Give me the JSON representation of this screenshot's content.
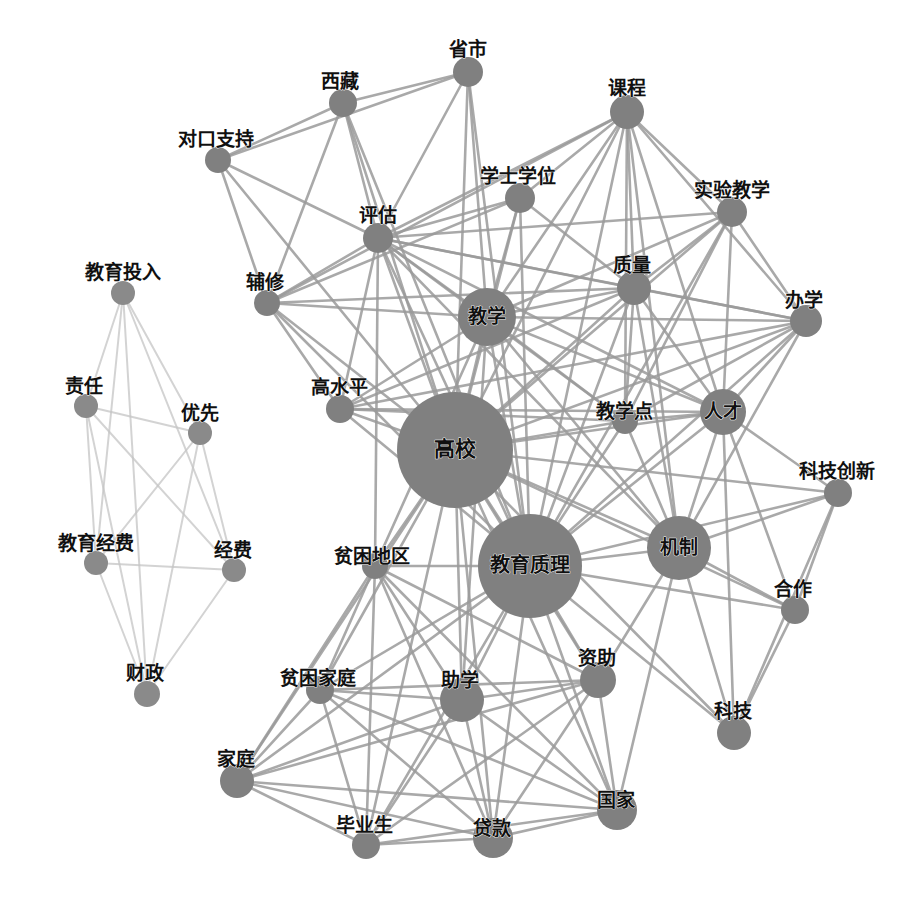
{
  "figure": {
    "type": "network-graph",
    "title": "",
    "background_color": "#ffffff",
    "node_color": "#808080",
    "node_color_secondary": "#8a8a8a",
    "edge_color": "#9a9a9a",
    "edge_color_light": "#c4c4c4",
    "label_color": "#101010",
    "width": 924,
    "height": 897
  },
  "chart_data": {
    "type": "network",
    "title": "",
    "xlabel": "",
    "ylabel": "",
    "legend": [],
    "grid": false,
    "node_count": 33,
    "edge_count": 178,
    "cluster_names": [
      "main-education-quality-cluster",
      "education-funding-cluster"
    ],
    "nodes": [
      {
        "id": "shengshi",
        "label": "省市",
        "x": 468,
        "y": 72,
        "r": 15,
        "label_dx": 0,
        "label_dy": -22,
        "fs": 19,
        "cluster": 0
      },
      {
        "id": "xizang",
        "label": "西藏",
        "x": 343,
        "y": 103,
        "r": 14,
        "label_dx": -3,
        "label_dy": -21,
        "fs": 19,
        "cluster": 0
      },
      {
        "id": "kecheng",
        "label": "课程",
        "x": 627,
        "y": 112,
        "r": 17,
        "label_dx": 0,
        "label_dy": -23,
        "fs": 19,
        "cluster": 0
      },
      {
        "id": "duikouzhichi",
        "label": "对口支持",
        "x": 218,
        "y": 160,
        "r": 13,
        "label_dx": -2,
        "label_dy": -20,
        "fs": 19,
        "cluster": 0
      },
      {
        "id": "xueshixuewei",
        "label": "学士学位",
        "x": 520,
        "y": 198,
        "r": 15,
        "label_dx": -2,
        "label_dy": -21,
        "fs": 19,
        "cluster": 0
      },
      {
        "id": "shiyanjiaoxue",
        "label": "实验教学",
        "x": 732,
        "y": 212,
        "r": 15,
        "label_dx": 0,
        "label_dy": -21,
        "fs": 19,
        "cluster": 0
      },
      {
        "id": "pinggu",
        "label": "评估",
        "x": 378,
        "y": 238,
        "r": 15,
        "label_dx": 0,
        "label_dy": -22,
        "fs": 19,
        "cluster": 0
      },
      {
        "id": "jiaoyutouru",
        "label": "教育投入",
        "x": 123,
        "y": 293,
        "r": 12,
        "label_dx": 0,
        "label_dy": -20,
        "fs": 19,
        "cluster": 1
      },
      {
        "id": "zhiliang",
        "label": "质量",
        "x": 634,
        "y": 288,
        "r": 17,
        "label_dx": -2,
        "label_dy": -22,
        "fs": 19,
        "cluster": 0
      },
      {
        "id": "fuxiu",
        "label": "辅修",
        "x": 267,
        "y": 303,
        "r": 13,
        "label_dx": -2,
        "label_dy": -20,
        "fs": 19,
        "cluster": 0
      },
      {
        "id": "jiaoxue",
        "label": "教学",
        "x": 487,
        "y": 317,
        "r": 29,
        "label_dx": 0,
        "label_dy": 0,
        "fs": 19,
        "cluster": 0
      },
      {
        "id": "banxue",
        "label": "办学",
        "x": 806,
        "y": 321,
        "r": 16,
        "label_dx": -2,
        "label_dy": -20,
        "fs": 19,
        "cluster": 0
      },
      {
        "id": "zeren",
        "label": "责任",
        "x": 86,
        "y": 406,
        "r": 12,
        "label_dx": -2,
        "label_dy": -19,
        "fs": 19,
        "cluster": 1
      },
      {
        "id": "youxian",
        "label": "优先",
        "x": 200,
        "y": 433,
        "r": 12,
        "label_dx": 0,
        "label_dy": -19,
        "fs": 19,
        "cluster": 1
      },
      {
        "id": "gaoshuiping",
        "label": "高水平",
        "x": 340,
        "y": 409,
        "r": 14,
        "label_dx": -1,
        "label_dy": -21,
        "fs": 19,
        "cluster": 0
      },
      {
        "id": "rencai",
        "label": "人才",
        "x": 723,
        "y": 412,
        "r": 23,
        "label_dx": 0,
        "label_dy": 0,
        "fs": 19,
        "cluster": 0
      },
      {
        "id": "jiaoxuedian",
        "label": "教学点",
        "x": 625,
        "y": 421,
        "r": 13,
        "label_dx": -1,
        "label_dy": -9,
        "fs": 19,
        "cluster": 0
      },
      {
        "id": "gaoxiao",
        "label": "高校",
        "x": 455,
        "y": 450,
        "r": 58,
        "label_dx": 0,
        "label_dy": 0,
        "fs": 21,
        "cluster": 0
      },
      {
        "id": "kejichuangxin",
        "label": "科技创新",
        "x": 838,
        "y": 493,
        "r": 14,
        "label_dx": -1,
        "label_dy": -21,
        "fs": 19,
        "cluster": 0
      },
      {
        "id": "jiaoyujingfei",
        "label": "教育经费",
        "x": 96,
        "y": 563,
        "r": 12,
        "label_dx": 0,
        "label_dy": -19,
        "fs": 19,
        "cluster": 1
      },
      {
        "id": "jizhi",
        "label": "机制",
        "x": 679,
        "y": 548,
        "r": 32,
        "label_dx": 0,
        "label_dy": 0,
        "fs": 19,
        "cluster": 0
      },
      {
        "id": "jingfei",
        "label": "经费",
        "x": 234,
        "y": 570,
        "r": 12,
        "label_dx": -1,
        "label_dy": -19,
        "fs": 19,
        "cluster": 1
      },
      {
        "id": "pinkundiqu",
        "label": "贫困地区",
        "x": 375,
        "y": 566,
        "r": 13,
        "label_dx": -3,
        "label_dy": -9,
        "fs": 19,
        "cluster": 0
      },
      {
        "id": "jiaoyuzhili",
        "label": "教育质理",
        "x": 530,
        "y": 566,
        "r": 52,
        "label_dx": 0,
        "label_dy": 0,
        "fs": 20,
        "cluster": 0
      },
      {
        "id": "hezuo",
        "label": "合作",
        "x": 795,
        "y": 610,
        "r": 14,
        "label_dx": -2,
        "label_dy": -20,
        "fs": 19,
        "cluster": 0
      },
      {
        "id": "caizheng",
        "label": "财政",
        "x": 147,
        "y": 694,
        "r": 13,
        "label_dx": -2,
        "label_dy": -20,
        "fs": 19,
        "cluster": 1
      },
      {
        "id": "zizhu",
        "label": "资助",
        "x": 598,
        "y": 680,
        "r": 18,
        "label_dx": -1,
        "label_dy": -21,
        "fs": 19,
        "cluster": 0
      },
      {
        "id": "pinkunjiating",
        "label": "贫困家庭",
        "x": 320,
        "y": 690,
        "r": 14,
        "label_dx": -2,
        "label_dy": -11,
        "fs": 19,
        "cluster": 0
      },
      {
        "id": "zhuxue",
        "label": "助学",
        "x": 462,
        "y": 700,
        "r": 22,
        "label_dx": -2,
        "label_dy": -19,
        "fs": 19,
        "cluster": 0
      },
      {
        "id": "keji",
        "label": "科技",
        "x": 734,
        "y": 733,
        "r": 17,
        "label_dx": -1,
        "label_dy": -21,
        "fs": 19,
        "cluster": 0
      },
      {
        "id": "jiating",
        "label": "家庭",
        "x": 237,
        "y": 781,
        "r": 17,
        "label_dx": -1,
        "label_dy": -21,
        "fs": 19,
        "cluster": 0
      },
      {
        "id": "guojia",
        "label": "国家",
        "x": 617,
        "y": 810,
        "r": 20,
        "label_dx": -1,
        "label_dy": -9,
        "fs": 19,
        "cluster": 0
      },
      {
        "id": "biyesheng",
        "label": "毕业生",
        "x": 366,
        "y": 845,
        "r": 14,
        "label_dx": -2,
        "label_dy": -19,
        "fs": 19,
        "cluster": 0
      },
      {
        "id": "daikuan",
        "label": "贷款",
        "x": 493,
        "y": 838,
        "r": 20,
        "label_dx": -1,
        "label_dy": -9,
        "fs": 19,
        "cluster": 0
      }
    ],
    "edges": [
      [
        "shengshi",
        "xizang"
      ],
      [
        "shengshi",
        "pinggu"
      ],
      [
        "shengshi",
        "gaoxiao"
      ],
      [
        "shengshi",
        "jiaoxue"
      ],
      [
        "shengshi",
        "jiaoyuzhili"
      ],
      [
        "shengshi",
        "duikouzhichi"
      ],
      [
        "xizang",
        "duikouzhichi"
      ],
      [
        "xizang",
        "pinggu"
      ],
      [
        "xizang",
        "gaoxiao"
      ],
      [
        "xizang",
        "fuxiu"
      ],
      [
        "xizang",
        "jiaoyuzhili"
      ],
      [
        "duikouzhichi",
        "pinggu"
      ],
      [
        "duikouzhichi",
        "gaoxiao"
      ],
      [
        "duikouzhichi",
        "fuxiu"
      ],
      [
        "kecheng",
        "shiyanjiaoxue"
      ],
      [
        "kecheng",
        "zhiliang"
      ],
      [
        "kecheng",
        "jiaoxue"
      ],
      [
        "kecheng",
        "gaoxiao"
      ],
      [
        "kecheng",
        "xueshixuewei"
      ],
      [
        "kecheng",
        "pinggu"
      ],
      [
        "kecheng",
        "banxue"
      ],
      [
        "kecheng",
        "jiaoyuzhili"
      ],
      [
        "kecheng",
        "rencai"
      ],
      [
        "kecheng",
        "jiaoxuedian"
      ],
      [
        "kecheng",
        "fuxiu"
      ],
      [
        "kecheng",
        "jizhi"
      ],
      [
        "xueshixuewei",
        "jiaoxue"
      ],
      [
        "xueshixuewei",
        "gaoxiao"
      ],
      [
        "xueshixuewei",
        "pinggu"
      ],
      [
        "xueshixuewei",
        "zhiliang"
      ],
      [
        "xueshixuewei",
        "jiaoyuzhili"
      ],
      [
        "xueshixuewei",
        "fuxiu"
      ],
      [
        "shiyanjiaoxue",
        "zhiliang"
      ],
      [
        "shiyanjiaoxue",
        "jiaoxue"
      ],
      [
        "shiyanjiaoxue",
        "gaoxiao"
      ],
      [
        "shiyanjiaoxue",
        "banxue"
      ],
      [
        "shiyanjiaoxue",
        "jiaoyuzhili"
      ],
      [
        "shiyanjiaoxue",
        "rencai"
      ],
      [
        "shiyanjiaoxue",
        "jiaoxuedian"
      ],
      [
        "shiyanjiaoxue",
        "pinggu"
      ],
      [
        "pinggu",
        "jiaoxue"
      ],
      [
        "pinggu",
        "gaoxiao"
      ],
      [
        "pinggu",
        "zhiliang"
      ],
      [
        "pinggu",
        "jiaoyuzhili"
      ],
      [
        "pinggu",
        "fuxiu"
      ],
      [
        "pinggu",
        "gaoshuiping"
      ],
      [
        "pinggu",
        "jiaoxuedian"
      ],
      [
        "pinggu",
        "banxue"
      ],
      [
        "pinggu",
        "rencai"
      ],
      [
        "pinggu",
        "jizhi"
      ],
      [
        "pinggu",
        "pinkundiqu"
      ],
      [
        "zhiliang",
        "jiaoxue"
      ],
      [
        "zhiliang",
        "gaoxiao"
      ],
      [
        "zhiliang",
        "jiaoyuzhili"
      ],
      [
        "zhiliang",
        "banxue"
      ],
      [
        "zhiliang",
        "rencai"
      ],
      [
        "zhiliang",
        "jiaoxuedian"
      ],
      [
        "zhiliang",
        "jizhi"
      ],
      [
        "zhiliang",
        "fuxiu"
      ],
      [
        "zhiliang",
        "gaoshuiping"
      ],
      [
        "fuxiu",
        "jiaoxue"
      ],
      [
        "fuxiu",
        "gaoxiao"
      ],
      [
        "fuxiu",
        "jiaoyuzhili"
      ],
      [
        "fuxiu",
        "gaoshuiping"
      ],
      [
        "jiaoxue",
        "gaoxiao"
      ],
      [
        "jiaoxue",
        "jiaoyuzhili"
      ],
      [
        "jiaoxue",
        "gaoshuiping"
      ],
      [
        "jiaoxue",
        "jiaoxuedian"
      ],
      [
        "jiaoxue",
        "banxue"
      ],
      [
        "jiaoxue",
        "rencai"
      ],
      [
        "jiaoxue",
        "jizhi"
      ],
      [
        "jiaoxue",
        "pinkundiqu"
      ],
      [
        "jiaoxue",
        "zhuxue"
      ],
      [
        "banxue",
        "gaoxiao"
      ],
      [
        "banxue",
        "jiaoyuzhili"
      ],
      [
        "banxue",
        "rencai"
      ],
      [
        "banxue",
        "jiaoxuedian"
      ],
      [
        "banxue",
        "jizhi"
      ],
      [
        "banxue",
        "gaoshuiping"
      ],
      [
        "gaoshuiping",
        "gaoxiao"
      ],
      [
        "gaoshuiping",
        "jiaoyuzhili"
      ],
      [
        "gaoshuiping",
        "jiaoxuedian"
      ],
      [
        "gaoshuiping",
        "rencai"
      ],
      [
        "rencai",
        "gaoxiao"
      ],
      [
        "rencai",
        "jiaoyuzhili"
      ],
      [
        "rencai",
        "jizhi"
      ],
      [
        "rencai",
        "jiaoxuedian"
      ],
      [
        "rencai",
        "kejichuangxin"
      ],
      [
        "rencai",
        "hezuo"
      ],
      [
        "rencai",
        "keji"
      ],
      [
        "jiaoxuedian",
        "gaoxiao"
      ],
      [
        "jiaoxuedian",
        "jiaoyuzhili"
      ],
      [
        "jiaoxuedian",
        "jizhi"
      ],
      [
        "gaoxiao",
        "jiaoyuzhili"
      ],
      [
        "gaoxiao",
        "jizhi"
      ],
      [
        "gaoxiao",
        "pinkundiqu"
      ],
      [
        "gaoxiao",
        "pinkunjiating"
      ],
      [
        "gaoxiao",
        "zhuxue"
      ],
      [
        "gaoxiao",
        "zizhu"
      ],
      [
        "gaoxiao",
        "jiating"
      ],
      [
        "gaoxiao",
        "daikuan"
      ],
      [
        "gaoxiao",
        "guojia"
      ],
      [
        "gaoxiao",
        "biyesheng"
      ],
      [
        "gaoxiao",
        "kejichuangxin"
      ],
      [
        "gaoxiao",
        "keji"
      ],
      [
        "gaoxiao",
        "hezuo"
      ],
      [
        "jiaoyuzhili",
        "jizhi"
      ],
      [
        "jiaoyuzhili",
        "pinkundiqu"
      ],
      [
        "jiaoyuzhili",
        "pinkunjiating"
      ],
      [
        "jiaoyuzhili",
        "zhuxue"
      ],
      [
        "jiaoyuzhili",
        "zizhu"
      ],
      [
        "jiaoyuzhili",
        "jiating"
      ],
      [
        "jiaoyuzhili",
        "daikuan"
      ],
      [
        "jiaoyuzhili",
        "guojia"
      ],
      [
        "jiaoyuzhili",
        "biyesheng"
      ],
      [
        "jiaoyuzhili",
        "keji"
      ],
      [
        "jiaoyuzhili",
        "kejichuangxin"
      ],
      [
        "jiaoyuzhili",
        "hezuo"
      ],
      [
        "jizhi",
        "kejichuangxin"
      ],
      [
        "jizhi",
        "hezuo"
      ],
      [
        "jizhi",
        "keji"
      ],
      [
        "jizhi",
        "guojia"
      ],
      [
        "jizhi",
        "zizhu"
      ],
      [
        "kejichuangxin",
        "hezuo"
      ],
      [
        "kejichuangxin",
        "keji"
      ],
      [
        "hezuo",
        "keji"
      ],
      [
        "pinkundiqu",
        "pinkunjiating"
      ],
      [
        "pinkundiqu",
        "zhuxue"
      ],
      [
        "pinkundiqu",
        "jiating"
      ],
      [
        "pinkundiqu",
        "daikuan"
      ],
      [
        "pinkundiqu",
        "biyesheng"
      ],
      [
        "pinkundiqu",
        "guojia"
      ],
      [
        "pinkundiqu",
        "zizhu"
      ],
      [
        "pinkunjiating",
        "zhuxue"
      ],
      [
        "pinkunjiating",
        "jiating"
      ],
      [
        "pinkunjiating",
        "daikuan"
      ],
      [
        "pinkunjiating",
        "biyesheng"
      ],
      [
        "pinkunjiating",
        "guojia"
      ],
      [
        "pinkunjiating",
        "zizhu"
      ],
      [
        "zhuxue",
        "jiating"
      ],
      [
        "zhuxue",
        "daikuan"
      ],
      [
        "zhuxue",
        "biyesheng"
      ],
      [
        "zhuxue",
        "guojia"
      ],
      [
        "zhuxue",
        "zizhu"
      ],
      [
        "zizhu",
        "jiating"
      ],
      [
        "zizhu",
        "daikuan"
      ],
      [
        "zizhu",
        "biyesheng"
      ],
      [
        "zizhu",
        "guojia"
      ],
      [
        "jiating",
        "daikuan"
      ],
      [
        "jiating",
        "biyesheng"
      ],
      [
        "jiating",
        "guojia"
      ],
      [
        "biyesheng",
        "daikuan"
      ],
      [
        "biyesheng",
        "guojia"
      ],
      [
        "daikuan",
        "guojia"
      ],
      [
        "jiaoyutouru",
        "zeren"
      ],
      [
        "jiaoyutouru",
        "youxian"
      ],
      [
        "jiaoyutouru",
        "jiaoyujingfei"
      ],
      [
        "jiaoyutouru",
        "jingfei"
      ],
      [
        "jiaoyutouru",
        "caizheng"
      ],
      [
        "zeren",
        "youxian"
      ],
      [
        "zeren",
        "jiaoyujingfei"
      ],
      [
        "zeren",
        "jingfei"
      ],
      [
        "zeren",
        "caizheng"
      ],
      [
        "youxian",
        "jiaoyujingfei"
      ],
      [
        "youxian",
        "jingfei"
      ],
      [
        "youxian",
        "caizheng"
      ],
      [
        "jiaoyujingfei",
        "jingfei"
      ],
      [
        "jiaoyujingfei",
        "caizheng"
      ],
      [
        "jingfei",
        "caizheng"
      ]
    ]
  }
}
